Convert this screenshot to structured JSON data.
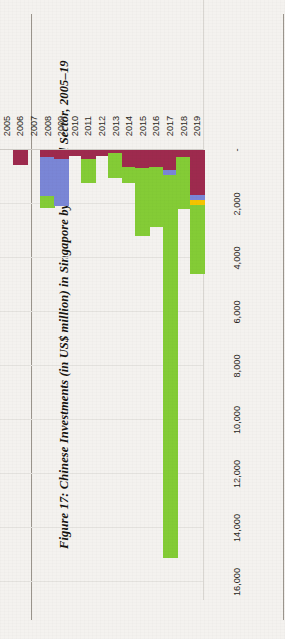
{
  "figure": {
    "caption": "Figure 17: Chinese Investments (in US$ million) in Singapore by Industrial Sector, 2005–19"
  },
  "chart_data": {
    "type": "bar",
    "orientation": "horizontal-stacked",
    "title": "Figure 17: Chinese Investments (in US$ million) in Singapore by Industrial Sector, 2005–19",
    "xlabel": "",
    "ylabel": "",
    "value_axis_label": "US$ million",
    "categories": [
      "2005",
      "2006",
      "2007",
      "2008",
      "2009",
      "2010",
      "2011",
      "2012",
      "2013",
      "2014",
      "2015",
      "2016",
      "2017",
      "2018",
      "2019"
    ],
    "tick_labels": [
      "-",
      "2,000",
      "4,000",
      "6,000",
      "8,000",
      "10,000",
      "12,000",
      "14,000",
      "16,000"
    ],
    "tick_values": [
      0,
      2000,
      4000,
      6000,
      8000,
      10000,
      12000,
      14000,
      16000
    ],
    "xlim": [
      0,
      16000
    ],
    "grid": true,
    "legend_position": "right",
    "series": [
      {
        "name": "Infrastructure",
        "color": "#9e2a4e",
        "values": [
          0,
          560,
          0,
          270,
          340,
          210,
          330,
          230,
          120,
          620,
          660,
          640,
          740,
          250,
          1680
        ]
      },
      {
        "name": "Energy",
        "color": "#7a86d6",
        "values": [
          0,
          0,
          0,
          1450,
          1730,
          0,
          0,
          0,
          0,
          0,
          0,
          0,
          180,
          0,
          160
        ]
      },
      {
        "name": "Metals",
        "color": "#f5c400",
        "values": [
          0,
          0,
          0,
          0,
          0,
          0,
          0,
          0,
          0,
          0,
          0,
          0,
          0,
          0,
          180
        ]
      },
      {
        "name": "Others",
        "color": "#84cc36",
        "values": [
          0,
          0,
          0,
          430,
          0,
          0,
          900,
          0,
          930,
          620,
          2540,
          2220,
          14200,
          1920,
          2580
        ]
      }
    ]
  }
}
